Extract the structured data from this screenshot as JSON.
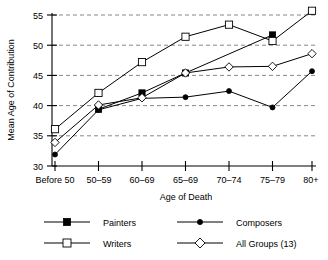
{
  "chart_data": {
    "type": "line",
    "title": "",
    "xlabel": "Age of Death",
    "ylabel": "Mean Age of Contribution",
    "categories": [
      "Before 50",
      "50–59",
      "60–69",
      "65–69",
      "70–74",
      "75–79",
      "80+"
    ],
    "ylim": [
      30,
      55
    ],
    "yticks": [
      30,
      35,
      40,
      45,
      50,
      55
    ],
    "ytick_labels": [
      "30",
      "35",
      "40",
      "45",
      "50",
      "55"
    ],
    "grid": "horizontal-dashed",
    "legend_position": "bottom",
    "series": [
      {
        "name": "Painters",
        "marker": "filled-square",
        "values": [
          null,
          39.4,
          42.1,
          45.4,
          null,
          51.7,
          null
        ]
      },
      {
        "name": "Writers",
        "marker": "open-square",
        "values": [
          36.1,
          42.1,
          47.2,
          51.4,
          53.4,
          50.7,
          55.7
        ]
      },
      {
        "name": "Composers",
        "marker": "filled-circle",
        "values": [
          31.9,
          39.3,
          41.2,
          41.4,
          42.4,
          39.7,
          45.7
        ]
      },
      {
        "name": "All Groups (13)",
        "marker": "open-diamond",
        "values": [
          33.9,
          40.1,
          41.3,
          45.4,
          46.4,
          46.5,
          48.6
        ]
      }
    ]
  },
  "legend": {
    "entries": [
      {
        "label": "Painters"
      },
      {
        "label": "Composers"
      },
      {
        "label": "Writers"
      },
      {
        "label": "All Groups (13)"
      }
    ]
  },
  "axes": {
    "y_title": "Mean Age of Contribution",
    "x_title": "Age of Death"
  }
}
